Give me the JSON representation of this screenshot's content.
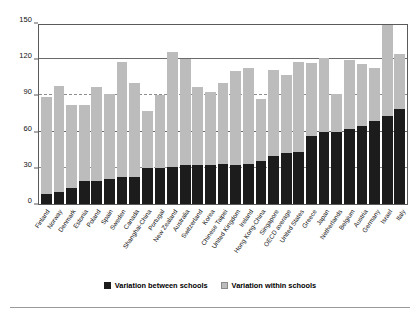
{
  "chart_data": {
    "type": "bar",
    "subtype": "stacked-vertical",
    "title": "",
    "xlabel": "",
    "ylabel": "",
    "ylim": [
      0,
      150
    ],
    "yticks": [
      0,
      30,
      60,
      90,
      120,
      150
    ],
    "ytick_labels": [
      "0",
      "30",
      "60",
      "90",
      "120",
      "150"
    ],
    "grid": "horizontal",
    "legend_position": "bottom-center",
    "categories": [
      "Finland",
      "Norway",
      "Denmark",
      "Estonia",
      "Poland",
      "Spain",
      "Sweden",
      "Canada",
      "Shanghai-China",
      "Portugal",
      "New Zealand",
      "Australia",
      "Switzerland",
      "Korea",
      "Chinese Taipei",
      "United Kingdom",
      "Ireland",
      "Hong Kong-China",
      "Singapore",
      "OECD average",
      "United States",
      "Greece",
      "Japan",
      "Netherlands",
      "Belgium",
      "Austria",
      "Germany",
      "Israel",
      "Italy"
    ],
    "series": [
      {
        "name": "Variation between schools",
        "color": "#1c1c1c",
        "values": [
          8,
          10,
          13,
          19,
          19,
          21,
          22,
          22,
          30,
          30,
          31,
          32,
          32,
          32,
          33,
          32,
          33,
          36,
          40,
          42,
          43,
          56,
          60,
          60,
          62,
          65,
          69,
          73,
          79
        ]
      },
      {
        "name": "Variation within schools",
        "color": "#bcbcbc",
        "values": [
          81,
          88,
          69,
          63,
          78,
          70,
          96,
          78,
          47,
          60,
          95,
          88,
          65,
          61,
          67,
          78,
          80,
          51,
          71,
          65,
          75,
          61,
          61,
          31,
          57,
          51,
          44,
          76,
          45
        ]
      }
    ],
    "totals": [
      89,
      98,
      82,
      82,
      97,
      91,
      118,
      100,
      77,
      90,
      126,
      120,
      97,
      93,
      100,
      110,
      113,
      87,
      111,
      107,
      118,
      117,
      121,
      91,
      119,
      116,
      113,
      149,
      124
    ]
  },
  "legend": {
    "items": [
      {
        "label": "Variation between schools",
        "swatch": "black-square"
      },
      {
        "label": "Variation within schools",
        "swatch": "grey-square"
      }
    ]
  }
}
